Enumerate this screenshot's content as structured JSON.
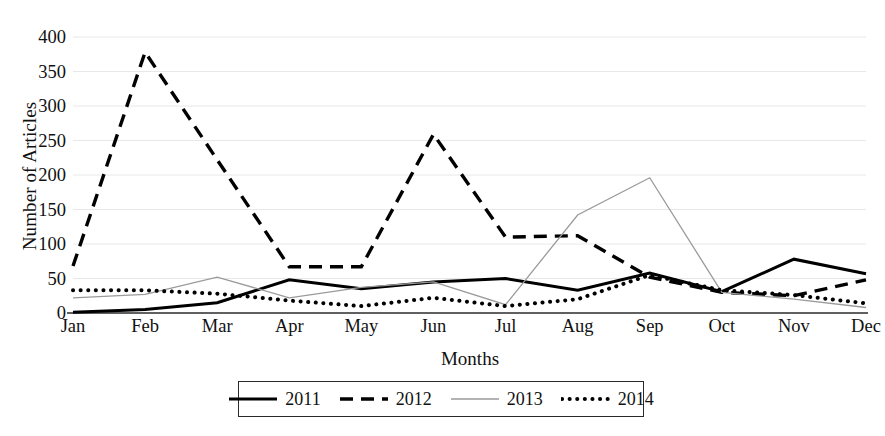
{
  "chart_data": {
    "type": "line",
    "title": "",
    "xlabel": "Months",
    "ylabel": "Number of Articles",
    "categories": [
      "Jan",
      "Feb",
      "Mar",
      "Apr",
      "May",
      "Jun",
      "Jul",
      "Aug",
      "Sep",
      "Oct",
      "Nov",
      "Dec"
    ],
    "ylim": [
      0,
      400
    ],
    "yticks": [
      0,
      50,
      100,
      150,
      200,
      250,
      300,
      350,
      400
    ],
    "grid": true,
    "legend_position": "bottom",
    "series": [
      {
        "name": "2011",
        "style": "solid",
        "color": "#000000",
        "values": [
          1,
          5,
          15,
          48,
          35,
          45,
          50,
          33,
          58,
          31,
          78,
          57
        ]
      },
      {
        "name": "2012",
        "style": "dashed",
        "color": "#000000",
        "values": [
          68,
          378,
          222,
          67,
          67,
          259,
          110,
          112,
          52,
          30,
          25,
          48
        ]
      },
      {
        "name": "2013",
        "style": "thin-solid",
        "color": "#9a9a9a",
        "values": [
          22,
          27,
          52,
          22,
          37,
          45,
          12,
          142,
          196,
          30,
          20,
          8
        ]
      },
      {
        "name": "2014",
        "style": "dotted",
        "color": "#000000",
        "values": [
          33,
          33,
          28,
          18,
          10,
          22,
          10,
          20,
          55,
          33,
          26,
          14
        ]
      }
    ]
  },
  "legend": {
    "entries": [
      {
        "label": "2011"
      },
      {
        "label": "2012"
      },
      {
        "label": "2013"
      },
      {
        "label": "2014"
      }
    ]
  },
  "axes": {
    "y_title": "Number of Articles",
    "x_title": "Months"
  }
}
